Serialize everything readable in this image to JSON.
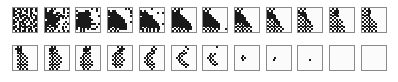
{
  "figure": {
    "grid_size": 13,
    "legend_symbols": {
      "#": "filled cell",
      ".": "empty cell"
    },
    "rows": [
      {
        "frames": [
          [
            "#.##.#.#.##.#",
            "##..#.##.#..#",
            "#.###..#.##..",
            "##.#.##..#.#.",
            "#..###.#.#..#",
            ".##.#.###.#.#",
            "#.#..##.#..##",
            "##.###.#.#.#.",
            "#..#.##..##.#",
            ".#.##.#.#..##",
            "##.#.###.#.#.",
            "#.##..#.##..#",
            ".#.#.##.#.#.#"
          ],
          [
            "#..#.#....#.#",
            "#.###.....#..",
            "####..##..#.#",
            "#######.#....",
            "######.####.#",
            "########.#.#.",
            ".#######.....",
            "#######....#.",
            "######.#..#.#",
            "##.####......",
            "#.#..##..#.#.",
            "##.#.#...#...",
            "#.#.#..#..#.#"
          ],
          [
            "........#..#.",
            "#....##....#.",
            ".#######.....",
            "########.....",
            "#######.....#",
            ".#######.....",
            "#########....",
            "########.....",
            "###########.#",
            "########.....",
            "#.######...#.",
            "#.#.#.#.###..",
            "..#.#........"
          ],
          [
            ".........#.#.",
            "#.##........#",
            "#####.......#",
            "######.......",
            ".######.....#",
            "########.....",
            "#########....",
            "#########...#",
            "##########...",
            "##########...",
            "##.#######...",
            "#.#.#.####...",
            ".#.#.#.......#"
          ],
          [
            "......#......",
            "#.#..........",
            "####.....#..#",
            "#####........",
            ".######......",
            "#######......",
            "########.....",
            "#########....",
            "##########..#",
            "##########...",
            "#.#.#######..",
            "##.#.#.#.##..",
            ".#.#.#.#.#..."
          ],
          [
            ".#.#.#.......",
            "#.##.........",
            "####.........",
            "#####........",
            "######.......",
            "#######......",
            "########.....",
            "#########....",
            "##########...",
            "##########...",
            "#.#.#######..",
            ".#.#.#.####..",
            "#.#.#.#.#...."
          ],
          [
            ".#.#.........",
            "#.#..........",
            "###..........",
            "####.........",
            "#####........",
            "######.......",
            "#######......",
            "########.....",
            "#########....",
            "#########....",
            ".#.#.####....",
            "#.#.#.#.#...#",
            ".#.#.#.#....."
          ],
          [
            ".#.#.........",
            "#.#..........",
            "###..........",
            "####.........",
            "#####........",
            "######.......",
            "######.......",
            "#######......",
            "#.#.####.....",
            ".#.#.###.....",
            "#.#.#.#.#....",
            ".#.#.#.#.....",
            "#.#.#.#.#...."
          ],
          [
            ".#.#.........",
            "#.#..........",
            "###..........",
            "####.........",
            "#####........",
            "#####........",
            ".#.###.......",
            "#.#.###......",
            ".#.#.##......",
            "#.#.#.#......",
            ".#.#.#.#.....",
            "#.#.#.#.#....",
            ".#.#.#.#....."
          ],
          [
            ".#.#.........",
            "#.#..........",
            "####.........",
            ".####........",
            "#.###........",
            ".#.##........",
            "#.#.##.......",
            ".#.#.##......",
            "#.#.#.#......",
            ".#.#.#.#.....",
            "#.#.#.#......",
            ".#.#.#.#.....",
            "#.#.#.#......"
          ],
          [
            ".#.#.........",
            "#.###........",
            ".####........",
            "#.##.........",
            ".#.##........",
            "#.#..........",
            ".#.#.#.......",
            "#.#.#.#......",
            ".#.#.#.......",
            "#.#.#.#......",
            ".#.#.#.#.....",
            "#.#.#.#......",
            ".#.#.#.#....."
          ],
          [
            ".#.#.........",
            "#.###........",
            ".#.##........",
            "#.##.........",
            ".#.#.........",
            "#.#.#........",
            ".#.#.#.......",
            "#.#.#.#......",
            ".#.#.#.#.....",
            "#.#.#.#......",
            ".#.#.#.#.....",
            "#.#.#.#......",
            ".#.#.#.#....."
          ]
        ]
      },
      {
        "frames": [
          [
            "..#.#........",
            ".####........",
            "..###........",
            "..#.#........",
            "...#.#.......",
            "..#.#.#......",
            "...#.#.#.....",
            "..#.#.#......",
            "...#.#.#.....",
            "..#.#.#......",
            "...#.#.#.....",
            "..#.#.#......",
            "...#.#.#....."
          ],
          [
            "...#.#.......",
            "..####.......",
            "..###.#......",
            "...#.#.......",
            "..#.#.#......",
            "...#.#.#.....",
            "..#.#.#.#....",
            "...#.#.#.....",
            "..#.#.#.#....",
            "...#.#.#.....",
            "..#.#.#......",
            "...#.#.#.....",
            "..#.#.#......"
          ],
          [
            ".....#.#.....",
            "....####.....",
            "....###......",
            ".....#.#.....",
            "....#.#......",
            "...#.#.#.....",
            "..#.#.#......",
            "...#.#.#.....",
            "..#.#.#.#....",
            "...#.#.#.....",
            "..#.#.#.#....",
            "...#.#.#.....",
            "....#.#......"
          ],
          [
            ".....#.#.....",
            "......###....",
            ".....###.....",
            "....#.#......",
            "...#.#.#.....",
            "..#.#.#......",
            "...#.#.#.....",
            "..#.#.#.#....",
            "...#.#.#.....",
            "..#.#.#......",
            "...#.#.#.....",
            "....#.#......",
            "............."
          ],
          [
            ".......#.....",
            "......#.#....",
            "......##.....",
            ".....#.#.....",
            "....#.#......",
            "...#.#.......",
            "..#.#.#......",
            "...#.#.......",
            "..#.#.#......",
            "...#.#.#.....",
            "....#.#......",
            ".....#.#.....",
            "......#......"
          ],
          [
            ".......#.....",
            "........#....",
            "......#......",
            ".....#.#.....",
            "....#.#......",
            "...#.#.......",
            "..#.#........",
            "...#.#.......",
            "....#.#......",
            ".....#.#.....",
            "......#.#....",
            ".......#.....",
            "............."
          ],
          [
            ".......#.....",
            ".............",
            ".............",
            " ............",
            "....#.#......",
            "...#.#.......",
            "..#.#........",
            "...#.#.......",
            "....#.#......",
            ".....#.#.....",
            "......#......",
            ".............",
            "............."
          ],
          [
            ".............",
            ".............",
            ".............",
            ".............",
            ".............",
            "....#........",
            "...#.#.......",
            "....#........",
            ".............",
            ".............",
            ".............",
            ".............",
            "............."
          ],
          [
            ".............",
            ".............",
            ".............",
            ".............",
            ".............",
            ".............",
            "....#........",
            "...#.........",
            ".............",
            ".............",
            ".............",
            ".............",
            "............."
          ],
          [
            ".............",
            ".............",
            ".............",
            ".............",
            ".............",
            ".............",
            ".............",
            "......#......",
            ".............",
            ".............",
            ".............",
            ".............",
            "............."
          ],
          [
            ".............",
            ".............",
            ".............",
            ".............",
            ".............",
            ".............",
            ".............",
            ".............",
            ".............",
            ".............",
            ".............",
            ".............",
            "............."
          ],
          [
            ".............",
            ".............",
            ".............",
            ".............",
            ".............",
            ".............",
            ".............",
            ".............",
            ".............",
            ".............",
            ".............",
            ".............",
            "............."
          ]
        ]
      }
    ]
  }
}
